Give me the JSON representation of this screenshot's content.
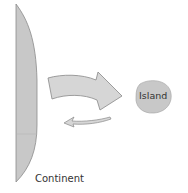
{
  "diagram": {
    "continent_label": "Continent",
    "island_label": "Island",
    "colors": {
      "land_fill": "#c8c8c8",
      "land_stroke": "#8a8a8a",
      "arrow_fill": "#d6d6d6",
      "arrow_stroke": "#888888",
      "text": "#333333"
    },
    "arrows": [
      {
        "name": "large-arrow",
        "direction": "continent-to-island"
      },
      {
        "name": "small-arrow",
        "direction": "island-to-continent"
      }
    ]
  }
}
